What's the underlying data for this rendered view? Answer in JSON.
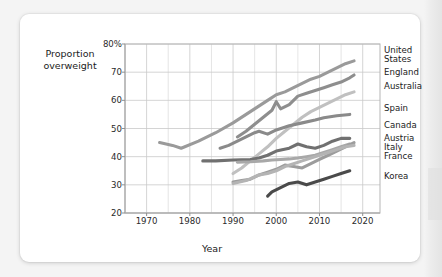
{
  "chart_data": {
    "type": "line",
    "title": "",
    "xlabel": "Year",
    "ylabel": "Proportion overweight",
    "ylabel_line1": "Proportion",
    "ylabel_line2": "overweight",
    "xlim": [
      1965,
      2024
    ],
    "ylim": [
      20,
      80
    ],
    "xticks": [
      1970,
      1980,
      1990,
      2000,
      2010,
      2020
    ],
    "xtick_labels": [
      "1970",
      "1980",
      "1990",
      "2000",
      "2010",
      "2020"
    ],
    "yticks": [
      20,
      30,
      40,
      50,
      60,
      70,
      80
    ],
    "ytick_labels": [
      "20",
      "30",
      "40",
      "50",
      "60",
      "70",
      "80%"
    ],
    "grid": true,
    "legend_position": "right-of-axes-at-line-end",
    "units": "percent",
    "series": [
      {
        "name": "United States",
        "label_line1": "United",
        "label_line2": "States",
        "color": "#9a9a9a",
        "x": [
          1973,
          1976,
          1978,
          1982,
          1986,
          1990,
          1994,
          1998,
          2000,
          2002,
          2004,
          2006,
          2008,
          2010,
          2012,
          2014,
          2016,
          2018
        ],
        "y": [
          45.0,
          44.0,
          43.0,
          45.5,
          48.5,
          52.0,
          56.0,
          60.0,
          62.0,
          63.0,
          64.5,
          66.0,
          67.5,
          68.5,
          70.0,
          71.5,
          73.0,
          74.0
        ]
      },
      {
        "name": "England",
        "label_line1": "England",
        "label_line2": "",
        "color": "#8e8e8e",
        "x": [
          1991,
          1993,
          1995,
          1997,
          1999,
          2000,
          2001,
          2003,
          2005,
          2007,
          2009,
          2011,
          2013,
          2015,
          2017,
          2018
        ],
        "y": [
          47.0,
          49.0,
          51.5,
          54.0,
          56.5,
          59.5,
          57.0,
          58.5,
          61.5,
          62.5,
          63.5,
          64.5,
          65.5,
          66.5,
          68.0,
          69.0
        ]
      },
      {
        "name": "Australia",
        "label_line1": "Australia",
        "label_line2": "",
        "color": "#c0c0c0",
        "x": [
          1990,
          1992,
          1994,
          1996,
          1998,
          2000,
          2002,
          2004,
          2006,
          2008,
          2010,
          2012,
          2014,
          2016,
          2018
        ],
        "y": [
          34.0,
          36.0,
          38.5,
          41.0,
          43.5,
          46.5,
          49.0,
          51.5,
          54.0,
          56.0,
          57.5,
          59.0,
          60.5,
          62.0,
          63.0
        ]
      },
      {
        "name": "Spain",
        "label_line1": "Spain",
        "label_line2": "",
        "color": "#8a8a8a",
        "x": [
          1987,
          1989,
          1991,
          1993,
          1995,
          1996,
          1998,
          2000,
          2003,
          2006,
          2009,
          2011,
          2014,
          2017
        ],
        "y": [
          43.0,
          44.0,
          45.5,
          47.0,
          48.5,
          49.0,
          48.0,
          49.5,
          51.0,
          52.0,
          53.0,
          53.8,
          54.5,
          55.0
        ]
      },
      {
        "name": "Canada",
        "label_line1": "Canada",
        "label_line2": "",
        "color": "#707070",
        "x": [
          1983,
          1986,
          1990,
          1994,
          1996,
          1998,
          2000,
          2003,
          2005,
          2007,
          2009,
          2011,
          2013,
          2015,
          2017
        ],
        "y": [
          38.5,
          38.5,
          38.8,
          39.0,
          39.5,
          40.5,
          42.0,
          43.0,
          44.5,
          43.5,
          43.0,
          44.0,
          45.5,
          46.5,
          46.5
        ]
      },
      {
        "name": "Austria",
        "label_line1": "Austria",
        "label_line2": "",
        "color": "#a8a8a8",
        "x": [
          1991,
          1994,
          1997,
          1999,
          2001,
          2003,
          2005,
          2007,
          2009,
          2011,
          2013,
          2015,
          2017
        ],
        "y": [
          38.0,
          38.2,
          38.5,
          38.8,
          39.0,
          39.2,
          39.5,
          40.0,
          40.5,
          41.5,
          42.5,
          43.5,
          44.5
        ]
      },
      {
        "name": "Italy",
        "label_line1": "Italy",
        "label_line2": "",
        "color": "#9c9c9c",
        "x": [
          1990,
          1992,
          1994,
          1996,
          1998,
          2000,
          2002,
          2004,
          2006,
          2008,
          2010,
          2012,
          2014,
          2016,
          2018
        ],
        "y": [
          31.0,
          31.5,
          32.0,
          33.5,
          34.5,
          35.5,
          37.0,
          36.5,
          36.0,
          37.5,
          39.0,
          40.5,
          42.0,
          43.5,
          45.0
        ]
      },
      {
        "name": "France",
        "label_line1": "France",
        "label_line2": "",
        "color": "#b4b4b4",
        "x": [
          1990,
          1993,
          1996,
          1998,
          2000,
          2002,
          2004,
          2006,
          2008,
          2010,
          2012,
          2014,
          2016,
          2018
        ],
        "y": [
          30.5,
          31.5,
          33.5,
          34.0,
          35.0,
          36.5,
          37.5,
          38.5,
          39.5,
          40.5,
          41.5,
          42.5,
          43.5,
          44.0
        ]
      },
      {
        "name": "Korea",
        "label_line1": "Korea",
        "label_line2": "",
        "color": "#4a4a4a",
        "x": [
          1998,
          1999,
          2001,
          2003,
          2005,
          2007,
          2009,
          2011,
          2013,
          2015,
          2017
        ],
        "y": [
          26.0,
          27.5,
          29.0,
          30.5,
          31.0,
          30.0,
          31.0,
          32.0,
          33.0,
          34.0,
          35.0
        ]
      }
    ]
  },
  "legend_labels": [
    {
      "line1": "United",
      "line2": "States"
    },
    {
      "line1": "England",
      "line2": ""
    },
    {
      "line1": "Australia",
      "line2": ""
    },
    {
      "line1": "Spain",
      "line2": ""
    },
    {
      "line1": "Canada",
      "line2": ""
    },
    {
      "line1": "Austria",
      "line2": ""
    },
    {
      "line1": "Italy",
      "line2": ""
    },
    {
      "line1": "France",
      "line2": ""
    },
    {
      "line1": "Korea",
      "line2": ""
    }
  ],
  "colors": {
    "page_background": "#f4f4f4",
    "card_background": "#ffffff",
    "grid": "#d2d2d2",
    "axis": "#b5b5b5",
    "text": "#1b1b1b"
  }
}
